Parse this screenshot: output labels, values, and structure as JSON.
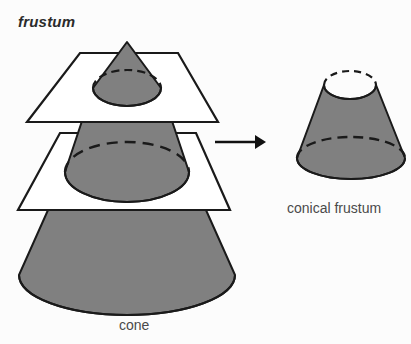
{
  "page": {
    "background_color": "#fcfcfc",
    "width": 411,
    "height": 344
  },
  "title": {
    "text": "frustum"
  },
  "labels": {
    "cone": "cone",
    "conical_frustum": "conical frustum"
  },
  "colors": {
    "solid_fill": "#808080",
    "outline": "#1a1a1a",
    "plane_fill": "#ffffff",
    "text": "#3a3a3a",
    "arrow": "#111111"
  },
  "diagram": {
    "type": "geometry-illustration",
    "elements": [
      {
        "name": "small-cone-tip",
        "kind": "cone",
        "apex": [
          127,
          42
        ],
        "base_center": [
          127,
          88
        ],
        "base_rx": 34,
        "base_ry": 18,
        "fill": "#808080"
      },
      {
        "name": "upper-cutting-plane",
        "kind": "plane",
        "corners": [
          [
            80,
            53
          ],
          [
            178,
            53
          ],
          [
            218,
            122
          ],
          [
            27,
            122
          ]
        ],
        "fill": "#ffffff"
      },
      {
        "name": "middle-frustum-band",
        "kind": "frustum",
        "top_center": [
          127,
          88
        ],
        "top_rx": 34,
        "top_ry": 18,
        "bottom_center": [
          127,
          172
        ],
        "bottom_rx": 62,
        "bottom_ry": 30,
        "fill": "#808080"
      },
      {
        "name": "lower-cutting-plane",
        "kind": "plane",
        "corners": [
          [
            60,
            133
          ],
          [
            196,
            133
          ],
          [
            230,
            210
          ],
          [
            18,
            210
          ]
        ],
        "fill": "#ffffff"
      },
      {
        "name": "large-cone-base",
        "kind": "frustum",
        "top_center": [
          127,
          172
        ],
        "top_rx": 62,
        "top_ry": 30,
        "bottom_center": [
          127,
          275
        ],
        "bottom_rx": 108,
        "bottom_ry": 40,
        "fill": "#808080"
      },
      {
        "name": "transform-arrow",
        "kind": "arrow",
        "from": [
          215,
          142
        ],
        "to": [
          264,
          142
        ]
      },
      {
        "name": "conical-frustum-result",
        "kind": "frustum",
        "top_center": [
          350,
          85
        ],
        "top_rx": 26,
        "top_ry": 14,
        "bottom_center": [
          351,
          158
        ],
        "bottom_rx": 54,
        "bottom_ry": 21,
        "fill": "#808080"
      }
    ]
  }
}
